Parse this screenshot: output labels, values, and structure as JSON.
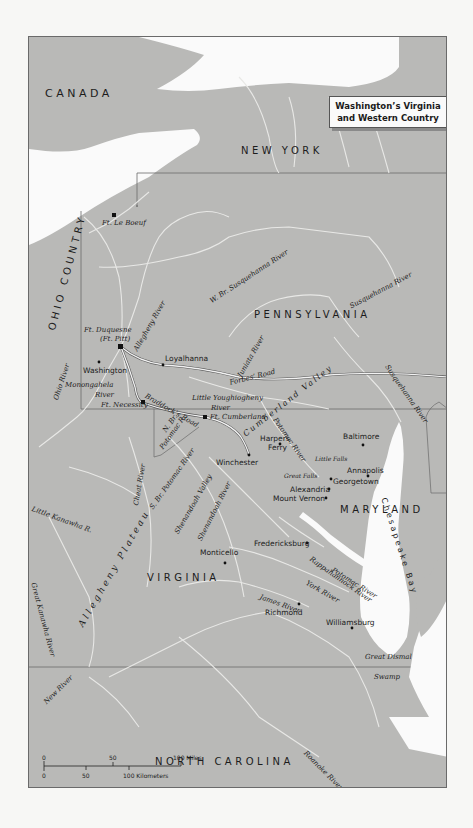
{
  "title": {
    "line1": "Washington’s Virginia",
    "line2": "and Western Country"
  },
  "colors": {
    "land": "#b9b9b7",
    "water": "#fafafa",
    "border": "#6a6a6a",
    "rivers": "#e6e6e4",
    "road": "#f4f4f4",
    "page": "#f7f7f5"
  },
  "regions": {
    "canada": "CANADA",
    "new_york": "NEW YORK",
    "ohio_country": "OHIO COUNTRY",
    "pennsylvania": "PENNSYLVANIA",
    "maryland": "MARYLAND",
    "virginia": "VIRGINIA",
    "north_carolina": "NORTH CAROLINA",
    "allegheny_plateau": "Allegheny Plateau"
  },
  "forts": {
    "le_boeuf": "Ft. Le Boeuf",
    "duquesne_1": "Ft. Duquesne",
    "duquesne_2": "(Ft. Pitt)",
    "necessity": "Ft. Necessity",
    "cumberland": "Ft. Cumberland"
  },
  "cities": {
    "loyalhanna": "Loyalhanna",
    "washington": "Washington",
    "harpers_1": "Harpers",
    "harpers_2": "Ferry",
    "winchester": "Winchester",
    "baltimore": "Baltimore",
    "annapolis": "Annapolis",
    "georgetown": "Georgetown",
    "alexandria": "Alexandria",
    "mount_vernon": "Mount Vernon",
    "fredericksburg": "Fredericksburg",
    "monticello": "Monticello",
    "richmond": "Richmond",
    "williamsburg": "Williamsburg"
  },
  "rivers": {
    "w_br_susquehanna": "W. Br. Susquehanna River",
    "susquehanna_upper": "Susquehanna River",
    "susquehanna_lower": "Susquehanna River",
    "allegheny": "Allegheny River",
    "juniata": "Juniata River",
    "monongahela_1": "Monongahela",
    "monongahela_2": "River",
    "ohio": "Ohio River",
    "little_youghiogheny_1": "Little Youghiogheny",
    "little_youghiogheny_2": "River",
    "n_br_potomac_1": "N. Br.",
    "n_br_potomac_2": "Potomac R.",
    "potomac_upper": "Potomac River",
    "potomac_lower": "Potomac River",
    "s_br_potomac": "S. Br. Potomac River",
    "cheat": "Cheat River",
    "little_kanawha": "Little Kanawha R.",
    "great_kanawha": "Great Kanawha River",
    "new_river": "New River",
    "shenandoah": "Shenandoah River",
    "rappahannock": "Rappahannock River",
    "york": "York River",
    "james": "James River",
    "roanoke": "Roanoke River"
  },
  "features": {
    "little_falls": "Little Falls",
    "great_falls": "Great Falls",
    "cumberland_valley": "Cumberland Valley",
    "shenandoah_valley": "Shenandoah Valley",
    "chesapeake_bay": "Chesapeake Bay",
    "great_dismal_1": "Great Dismal",
    "great_dismal_2": "Swamp"
  },
  "roads": {
    "braddocks": "Braddock’s Road",
    "forbes": "Forbes’ Road"
  },
  "scale": {
    "miles_0": "0",
    "miles_50": "50",
    "miles_100": "100 Miles",
    "km_0": "0",
    "km_50": "50",
    "km_100": "100 Kilometers"
  }
}
